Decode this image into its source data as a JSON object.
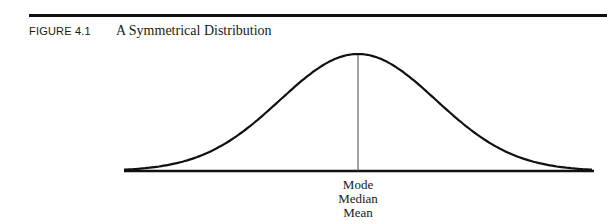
{
  "figure": {
    "label": "FIGURE 4.1",
    "title": "A Symmetrical Distribution"
  },
  "center_labels": [
    "Mode",
    "Median",
    "Mean"
  ],
  "chart_data": {
    "type": "line",
    "title": "A Symmetrical Distribution",
    "xlabel": "",
    "ylabel": "",
    "annotations": [
      {
        "x": 0,
        "text": "Mode"
      },
      {
        "x": 0,
        "text": "Median"
      },
      {
        "x": 0,
        "text": "Mean"
      }
    ],
    "x": [
      -3,
      -2.5,
      -2,
      -1.5,
      -1,
      -0.5,
      0,
      0.5,
      1,
      1.5,
      2,
      2.5,
      3
    ],
    "series": [
      {
        "name": "distribution",
        "values": [
          0.01,
          0.04,
          0.13,
          0.32,
          0.61,
          0.88,
          1.0,
          0.88,
          0.61,
          0.32,
          0.13,
          0.04,
          0.01
        ]
      }
    ],
    "grid": false,
    "legend": "none",
    "colors": {
      "curve": "#111111",
      "center_line": "#555555"
    }
  }
}
